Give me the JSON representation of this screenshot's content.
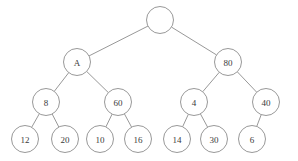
{
  "figure": {
    "name": "binary-tree-diagram",
    "type": "tree",
    "width": 298,
    "height": 161,
    "background_color": "#ffffff",
    "stroke_color": "#8c8c8c",
    "label_color": "#3a3a3a",
    "node_radius": 13.5
  },
  "nodes": [
    {
      "id": "root",
      "label": "",
      "cx": 160,
      "cy": 20,
      "r": 13.5,
      "depth": 0
    },
    {
      "id": "n-a",
      "label": "A",
      "cx": 77,
      "cy": 62,
      "r": 13.5,
      "depth": 1
    },
    {
      "id": "n-80",
      "label": "80",
      "cx": 228,
      "cy": 62,
      "r": 13.5,
      "depth": 1
    },
    {
      "id": "n-8",
      "label": "8",
      "cx": 46,
      "cy": 102,
      "r": 13.5,
      "depth": 2
    },
    {
      "id": "n-60",
      "label": "60",
      "cx": 118,
      "cy": 102,
      "r": 13.5,
      "depth": 2
    },
    {
      "id": "n-4",
      "label": "4",
      "cx": 194,
      "cy": 102,
      "r": 13.5,
      "depth": 2
    },
    {
      "id": "n-40",
      "label": "40",
      "cx": 266,
      "cy": 102,
      "r": 13.5,
      "depth": 2
    },
    {
      "id": "n-12",
      "label": "12",
      "cx": 25,
      "cy": 139,
      "r": 13.5,
      "depth": 3
    },
    {
      "id": "n-20",
      "label": "20",
      "cx": 65,
      "cy": 139,
      "r": 13.5,
      "depth": 3
    },
    {
      "id": "n-10",
      "label": "10",
      "cx": 100,
      "cy": 139,
      "r": 13.5,
      "depth": 3
    },
    {
      "id": "n-16",
      "label": "16",
      "cx": 138,
      "cy": 139,
      "r": 13.5,
      "depth": 3
    },
    {
      "id": "n-14",
      "label": "14",
      "cx": 177,
      "cy": 139,
      "r": 13.5,
      "depth": 3
    },
    {
      "id": "n-30",
      "label": "30",
      "cx": 214,
      "cy": 139,
      "r": 13.5,
      "depth": 3
    },
    {
      "id": "n-6",
      "label": "6",
      "cx": 252,
      "cy": 139,
      "r": 13.5,
      "depth": 3
    }
  ],
  "edges": [
    {
      "from": "root",
      "to": "n-a",
      "side": "left"
    },
    {
      "from": "root",
      "to": "n-80",
      "side": "right"
    },
    {
      "from": "n-a",
      "to": "n-8",
      "side": "left"
    },
    {
      "from": "n-a",
      "to": "n-60",
      "side": "right"
    },
    {
      "from": "n-80",
      "to": "n-4",
      "side": "left"
    },
    {
      "from": "n-80",
      "to": "n-40",
      "side": "right"
    },
    {
      "from": "n-8",
      "to": "n-12",
      "side": "left"
    },
    {
      "from": "n-8",
      "to": "n-20",
      "side": "right"
    },
    {
      "from": "n-60",
      "to": "n-10",
      "side": "left"
    },
    {
      "from": "n-60",
      "to": "n-16",
      "side": "right"
    },
    {
      "from": "n-4",
      "to": "n-14",
      "side": "left"
    },
    {
      "from": "n-4",
      "to": "n-30",
      "side": "right"
    },
    {
      "from": "n-40",
      "to": "n-6",
      "side": "left"
    }
  ]
}
